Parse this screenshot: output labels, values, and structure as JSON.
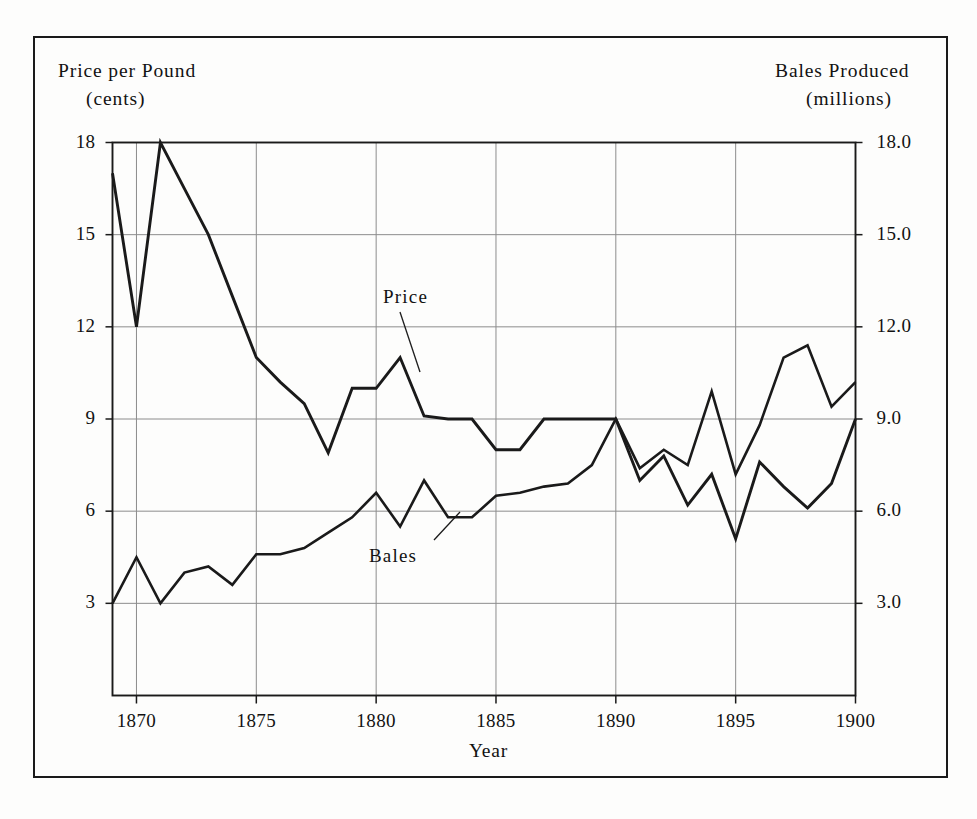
{
  "chart_data": {
    "type": "line",
    "title": "",
    "xlabel": "Year",
    "ylabel_left_line1": "Price per Pound",
    "ylabel_left_line2": "(cents)",
    "ylabel_right_line1": "Bales Produced",
    "ylabel_right_line2": "(millions)",
    "xlim": [
      1869,
      1900
    ],
    "xticks": [
      1870,
      1875,
      1880,
      1885,
      1890,
      1895,
      1900
    ],
    "xticklabels": [
      "1870",
      "1875",
      "1880",
      "1885",
      "1890",
      "1895",
      "1900"
    ],
    "ylim_left": [
      0,
      18
    ],
    "yticks_left": [
      3,
      6,
      9,
      12,
      15,
      18
    ],
    "yticklabels_left": [
      "3",
      "6",
      "9",
      "12",
      "15",
      "18"
    ],
    "ylim_right": [
      0,
      18
    ],
    "yticks_right": [
      3.0,
      6.0,
      9.0,
      12.0,
      15.0,
      18.0
    ],
    "yticklabels_right": [
      "3.0",
      "6.0",
      "9.0",
      "12.0",
      "15.0",
      "18.0"
    ],
    "grid": true,
    "legend": "annotated-inline",
    "annotations": [
      {
        "name": "price-annotation",
        "text": "Price",
        "x": 1880.0,
        "y": 12.4
      },
      {
        "name": "bales-annotation",
        "text": "Bales",
        "x": 1879.5,
        "y": 4.55
      }
    ],
    "x": [
      1869,
      1870,
      1871,
      1872,
      1873,
      1874,
      1875,
      1876,
      1877,
      1878,
      1879,
      1880,
      1881,
      1882,
      1883,
      1884,
      1885,
      1886,
      1887,
      1888,
      1889,
      1890,
      1891,
      1892,
      1893,
      1894,
      1895,
      1896,
      1897,
      1898,
      1899,
      1900
    ],
    "series": [
      {
        "name": "Price",
        "axis": "left",
        "units": "cents per pound",
        "values": [
          17.0,
          12.0,
          18.0,
          16.5,
          15.0,
          13.0,
          11.0,
          10.2,
          9.5,
          7.9,
          10.0,
          10.0,
          11.0,
          9.1,
          9.0,
          9.0,
          8.0,
          8.0,
          9.0,
          9.0,
          9.0,
          9.0,
          7.0,
          7.8,
          6.2,
          7.2,
          5.1,
          7.6,
          6.8,
          6.1,
          6.9,
          9.0
        ]
      },
      {
        "name": "Bales",
        "axis": "right",
        "units": "millions of bales",
        "values": [
          3.0,
          4.5,
          3.0,
          4.0,
          4.2,
          3.6,
          4.6,
          4.6,
          4.8,
          5.3,
          5.8,
          6.6,
          5.5,
          7.0,
          5.8,
          5.8,
          6.5,
          6.6,
          6.8,
          6.9,
          7.5,
          9.0,
          7.4,
          8.0,
          7.5,
          9.9,
          7.2,
          8.8,
          11.0,
          11.4,
          9.4,
          10.2
        ]
      }
    ]
  }
}
